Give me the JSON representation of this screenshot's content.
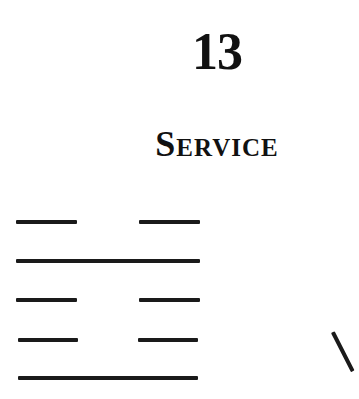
{
  "chapter": {
    "number": "13",
    "title": "Service"
  },
  "hexagram": {
    "lines": [
      {
        "type": "broken"
      },
      {
        "type": "solid"
      },
      {
        "type": "broken"
      },
      {
        "type": "broken"
      },
      {
        "type": "solid"
      }
    ]
  },
  "colors": {
    "ink": "#1a1a1a",
    "background": "#ffffff"
  }
}
